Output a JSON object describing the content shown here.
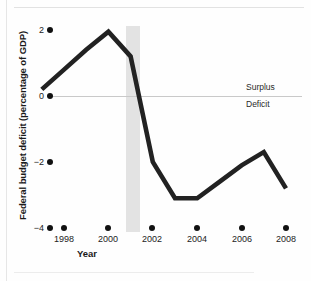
{
  "chart_data": {
    "type": "line",
    "title": "",
    "xlabel": "Year",
    "ylabel": "Federal budget deficit (percentage of GDP)",
    "xlim": [
      1997,
      2008
    ],
    "ylim": [
      -4,
      2
    ],
    "grid": false,
    "legend": "none",
    "x": [
      1997,
      1998,
      1999,
      2000,
      2001,
      2002,
      2003,
      2004,
      2005,
      2006,
      2007,
      2008
    ],
    "values": [
      0.2,
      0.8,
      1.4,
      1.95,
      1.2,
      -2.0,
      -3.1,
      -3.1,
      -2.6,
      -2.1,
      -1.7,
      -2.8
    ],
    "series": [
      {
        "name": "Federal budget deficit",
        "values": [
          0.2,
          0.8,
          1.4,
          1.95,
          1.2,
          -2.0,
          -3.1,
          -3.1,
          -2.6,
          -2.1,
          -1.7,
          -2.8
        ]
      }
    ],
    "x_tick_labels": [
      "1998",
      "2000",
      "2002",
      "2004",
      "2006",
      "2008"
    ],
    "x_tick_values": [
      1998,
      2000,
      2002,
      2004,
      2006,
      2008
    ],
    "y_tick_labels": [
      "2",
      "0",
      "−2",
      "−4"
    ],
    "y_tick_values": [
      2,
      0,
      -2,
      -4
    ],
    "zero_line": 0,
    "annotations": [
      {
        "name": "surplus",
        "text": "Surplus",
        "position": "above-zero-line-right"
      },
      {
        "name": "deficit",
        "text": "Deficit",
        "position": "below-zero-line-right"
      },
      {
        "name": "recession-band",
        "text": "",
        "x_start": 2001,
        "x_end": 2001.6
      }
    ],
    "colors": {
      "line": "#222222",
      "zero_line": "#c9c9c9",
      "recession_band": "#e3e3e3",
      "tick_dot": "#111111",
      "background": "#fefefe"
    }
  },
  "axes": {
    "y_title": "Federal budget deficit (percentage of GDP)",
    "x_title": "Year",
    "y_ticks": [
      {
        "label": "2",
        "value": 2
      },
      {
        "label": "0",
        "value": 0
      },
      {
        "label": "−2",
        "value": -2
      },
      {
        "label": "−4",
        "value": -4
      }
    ],
    "x_ticks": [
      {
        "label": "1998",
        "value": 1998
      },
      {
        "label": "2000",
        "value": 2000
      },
      {
        "label": "2002",
        "value": 2002
      },
      {
        "label": "2004",
        "value": 2004
      },
      {
        "label": "2006",
        "value": 2006
      },
      {
        "label": "2008",
        "value": 2008
      }
    ]
  },
  "annotations": {
    "surplus_label": "Surplus",
    "deficit_label": "Deficit"
  },
  "caption": {
    "text": ""
  }
}
